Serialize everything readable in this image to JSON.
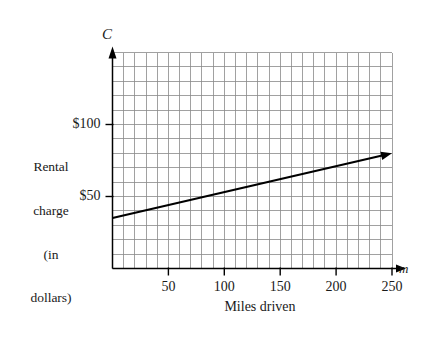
{
  "chart_data": {
    "type": "line",
    "title": "",
    "xlabel": "Miles driven",
    "ylabel": "Rental charge (in dollars)",
    "ylabel_lines": [
      "Rental",
      "charge",
      "(in",
      "dollars)"
    ],
    "x_axis_symbol": "m",
    "y_axis_symbol": "C",
    "xlim": [
      0,
      250
    ],
    "ylim": [
      0,
      150
    ],
    "xticks": [
      50,
      100,
      150,
      200,
      250
    ],
    "xtick_labels": [
      "50",
      "100",
      "150",
      "200",
      "250"
    ],
    "yticks": [
      50,
      100
    ],
    "ytick_labels": [
      "$50",
      "$100"
    ],
    "grid": true,
    "grid_x_step": 10,
    "grid_y_step": 10,
    "legend": "none",
    "series": [
      {
        "name": "Rental charge",
        "x": [
          0,
          250
        ],
        "values": [
          35,
          80
        ],
        "arrow_end": true
      }
    ],
    "annotations": []
  },
  "colors": {
    "grid": "#8a8a8a",
    "axis": "#000000",
    "line": "#000000",
    "background": "#ffffff",
    "text": "#1a1a1a"
  }
}
